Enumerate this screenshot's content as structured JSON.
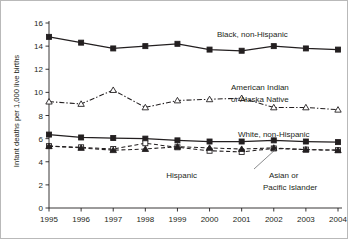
{
  "chart_data": {
    "type": "line",
    "title": "",
    "subtitle": "",
    "xlabel": "",
    "ylabel": "Infant deaths per 1,000 live births",
    "categories": [
      "1995",
      "1996",
      "1997",
      "1998",
      "1999",
      "2000",
      "2001",
      "2002",
      "2003",
      "2004"
    ],
    "x": [
      1995,
      1996,
      1997,
      1998,
      1999,
      2000,
      2001,
      2002,
      2003,
      2004
    ],
    "xlim": [
      1995,
      2004
    ],
    "ylim": [
      0,
      16
    ],
    "yticks": [
      "0",
      "2",
      "4",
      "6",
      "8",
      "10",
      "12",
      "14",
      "16"
    ],
    "ytick_values": [
      0,
      2,
      4,
      6,
      8,
      10,
      12,
      14,
      16
    ],
    "grid": false,
    "legend_position": "inline-annotations",
    "series": [
      {
        "name": "Black, non-Hispanic",
        "marker": "filled-square",
        "linestyle": "solid",
        "values": [
          14.8,
          14.3,
          13.8,
          14.0,
          14.2,
          13.7,
          13.6,
          14.0,
          13.8,
          13.7
        ]
      },
      {
        "name": "American Indian or Alaska Native",
        "marker": "open-triangle",
        "linestyle": "dash-dot",
        "values": [
          9.2,
          9.0,
          10.2,
          8.7,
          9.3,
          9.4,
          9.5,
          8.7,
          8.7,
          8.5
        ]
      },
      {
        "name": "White, non-Hispanic",
        "marker": "filled-square",
        "linestyle": "solid",
        "values": [
          6.35,
          6.1,
          6.05,
          6.0,
          5.85,
          5.75,
          5.75,
          5.85,
          5.75,
          5.7
        ]
      },
      {
        "name": "Asian or Pacific Islander",
        "marker": "open-square",
        "linestyle": "dashed",
        "values": [
          5.35,
          5.25,
          5.1,
          5.6,
          5.25,
          4.95,
          4.85,
          5.15,
          5.05,
          5.0
        ]
      },
      {
        "name": "Hispanic",
        "marker": "filled-triangle",
        "linestyle": "dashed",
        "values": [
          5.35,
          5.2,
          5.0,
          5.1,
          5.3,
          5.2,
          5.1,
          5.2,
          5.05,
          5.0
        ]
      }
    ],
    "annotations": [
      {
        "text": "Black, non-Hispanic",
        "series": "Black, non-Hispanic"
      },
      {
        "text": "American Indian",
        "series": "American Indian or Alaska Native"
      },
      {
        "text": "or Alaska Native",
        "series": "American Indian or Alaska Native"
      },
      {
        "text": "White, non-Hispanic",
        "series": "White, non-Hispanic"
      },
      {
        "text": "Hispanic",
        "series": "Hispanic"
      },
      {
        "text": "Asian or",
        "series": "Asian or Pacific Islander"
      },
      {
        "text": "Pacific Islander",
        "series": "Asian or Pacific Islander"
      }
    ],
    "colors": {
      "line": "#231f20",
      "text": "#231f20",
      "background": "#ffffff",
      "border": "#b9b9b9",
      "leader": "#56585a"
    }
  },
  "axes": {
    "ylabel": "Infant deaths per 1,000 live births",
    "ytick_labels": [
      "16",
      "14",
      "12",
      "10",
      "8",
      "6",
      "4",
      "2",
      "0"
    ],
    "xtick_labels": [
      "1995",
      "1996",
      "1997",
      "1998",
      "1999",
      "2000",
      "2001",
      "2002",
      "2003",
      "2004"
    ]
  },
  "labels": {
    "black": "Black, non-Hispanic",
    "amind_line1": "American Indian",
    "amind_line2": "or Alaska Native",
    "white": "White, non-Hispanic",
    "hispanic": "Hispanic",
    "asian_line1": "Asian or",
    "asian_line2": "Pacific Islander"
  }
}
